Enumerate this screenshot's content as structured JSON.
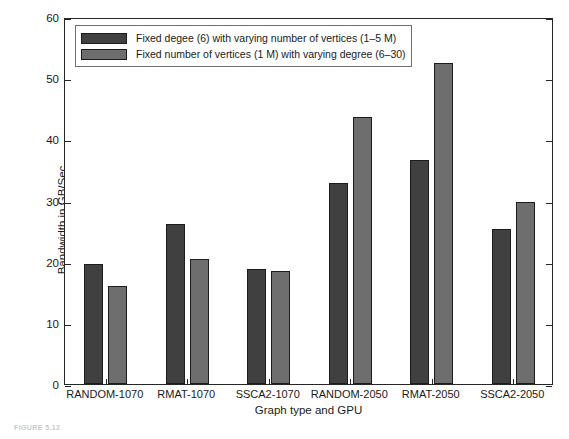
{
  "chart_data": {
    "type": "bar",
    "title": "",
    "xlabel": "Graph type and GPU",
    "ylabel": "Bandwidth in GB/Sec",
    "ylim": [
      0,
      60
    ],
    "yticks": [
      0,
      10,
      20,
      30,
      40,
      50,
      60
    ],
    "grid": false,
    "legend_position": "top-left",
    "categories": [
      "RANDOM-1070",
      "RMAT-1070",
      "SSCA2-1070",
      "RANDOM-2050",
      "RMAT-2050",
      "SSCA2-2050"
    ],
    "series": [
      {
        "name": "Fixed  degee (6) with varying number of vertices (1–5 M)",
        "color": "#404040",
        "values": [
          19.7,
          26.2,
          18.8,
          32.9,
          36.6,
          25.3
        ]
      },
      {
        "name": "Fixed number of vertices (1 M) with varying degree (6–30)",
        "color": "#6e6e6e",
        "values": [
          16.0,
          20.4,
          18.5,
          43.6,
          52.5,
          29.8
        ]
      }
    ]
  },
  "axis": {
    "y_tick_labels": [
      "0",
      "10",
      "20",
      "30",
      "40",
      "50",
      "60"
    ],
    "y_title": "Bandwidth in GB/Sec",
    "x_title": "Graph type and GPU"
  },
  "legend": {
    "entries": [
      {
        "label": "Fixed  degee (6) with varying number of vertices (1–5 M)"
      },
      {
        "label": "Fixed number of vertices (1 M) with varying degree (6–30)"
      }
    ]
  },
  "caption": {
    "text": "FIGURE 5.12"
  }
}
